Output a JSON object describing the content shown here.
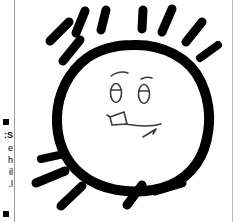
{
  "image": {
    "title": "Hand-drawn sun with a smiling face",
    "width": 233,
    "height": 222,
    "background_color": "#ffffff",
    "ink_color": "#000000",
    "rule_color": "#9a9a9a"
  },
  "cutoff_text": {
    "note": "Right-hand letter fragments of a text column cropped off the left edge of the screenshot",
    "lines": [
      {
        "text": "",
        "bullet": true,
        "top": 119
      },
      {
        "text": "S:",
        "top": 132,
        "bold": true
      },
      {
        "text": "e",
        "top": 145,
        "bold": false
      },
      {
        "text": "h",
        "top": 157,
        "bold": false
      },
      {
        "text": "il",
        "top": 169,
        "bold": false
      },
      {
        "text": "l.",
        "top": 181,
        "bold": false
      },
      {
        "text": "",
        "bullet": true,
        "top": 211
      }
    ]
  },
  "drawing": {
    "name": "sun-drawing",
    "body_label": "sun-body",
    "face": {
      "left_eye_label": "left-eye",
      "right_eye_label": "right-eye",
      "left_eyebrow_label": "left-eyebrow",
      "right_eyebrow_label": "right-eyebrow",
      "nose_label": "nose",
      "mouth_label": "mouth"
    },
    "ray_count": 13,
    "rays": [
      {
        "id": "ray-top-left-outer",
        "x1": 48,
        "y1": 61,
        "x2": 64,
        "y2": 40
      },
      {
        "id": "ray-top-left-mid",
        "x1": 35,
        "y1": 40,
        "x2": 53,
        "y2": 21
      },
      {
        "id": "ray-top-left-upper",
        "x1": 62,
        "y1": 31,
        "x2": 70,
        "y2": 10
      },
      {
        "id": "ray-top-center-left",
        "x1": 86,
        "y1": 29,
        "x2": 90,
        "y2": 9
      },
      {
        "id": "ray-top-center",
        "x1": 128,
        "y1": 28,
        "x2": 128,
        "y2": 9
      },
      {
        "id": "ray-top-center-right",
        "x1": 148,
        "y1": 30,
        "x2": 156,
        "y2": 8
      },
      {
        "id": "ray-top-right-upper",
        "x1": 172,
        "y1": 40,
        "x2": 186,
        "y2": 21
      },
      {
        "id": "ray-top-right-outer",
        "x1": 186,
        "y1": 57,
        "x2": 203,
        "y2": 44
      },
      {
        "id": "ray-bottom-left-top",
        "x1": 26,
        "y1": 159,
        "x2": 48,
        "y2": 155
      },
      {
        "id": "ray-bottom-left-mid",
        "x1": 22,
        "y1": 182,
        "x2": 49,
        "y2": 172
      },
      {
        "id": "ray-bottom-left-low",
        "x1": 47,
        "y1": 205,
        "x2": 66,
        "y2": 186
      },
      {
        "id": "ray-bottom-right-in",
        "x1": 113,
        "y1": 204,
        "x2": 126,
        "y2": 185
      },
      {
        "id": "ray-bottom-right-out",
        "x1": 141,
        "y1": 190,
        "x2": 166,
        "y2": 183
      }
    ]
  }
}
